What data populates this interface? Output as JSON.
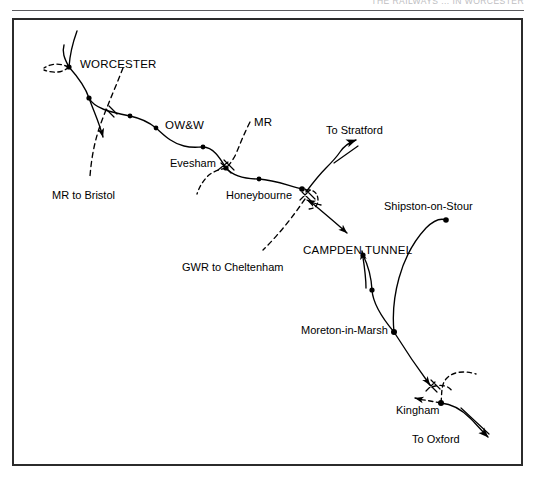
{
  "page": {
    "running_header": "THE RAILWAYS ... IN WORCESTER",
    "background_color": "#ffffff",
    "ink_color": "#000000",
    "frame_color": "#2b2b2b"
  },
  "figure": {
    "type": "railway-route-diagram",
    "frame": {
      "x": 12,
      "y": 18,
      "width": 511,
      "height": 448
    }
  },
  "labels": [
    {
      "id": "worcester",
      "text": "WORCESTER",
      "x": 80,
      "y": 59,
      "style": "caps"
    },
    {
      "id": "owandw",
      "text": "OW&W",
      "x": 165,
      "y": 120,
      "style": "caps"
    },
    {
      "id": "mr",
      "text": "MR",
      "x": 254,
      "y": 117,
      "style": "caps"
    },
    {
      "id": "to-stratford",
      "text": "To Stratford",
      "x": 326,
      "y": 125,
      "style": "normal"
    },
    {
      "id": "evesham",
      "text": "Evesham",
      "x": 170,
      "y": 158,
      "style": "normal"
    },
    {
      "id": "honeybourne",
      "text": "Honeybourne",
      "x": 226,
      "y": 190,
      "style": "normal"
    },
    {
      "id": "mr-to-bristol",
      "text": "MR to Bristol",
      "x": 52,
      "y": 190,
      "style": "normal"
    },
    {
      "id": "shipston-on-stour",
      "text": "Shipston-on-Stour",
      "x": 384,
      "y": 201,
      "style": "normal"
    },
    {
      "id": "campden-tunnel",
      "text": "CAMPDEN TUNNEL",
      "x": 303,
      "y": 245,
      "style": "caps"
    },
    {
      "id": "gwr-to-cheltenham",
      "text": "GWR to Cheltenham",
      "x": 182,
      "y": 262,
      "style": "normal"
    },
    {
      "id": "moreton-in-marsh",
      "text": "Moreton-in-Marsh",
      "x": 301,
      "y": 325,
      "style": "normal"
    },
    {
      "id": "kingham",
      "text": "Kingham",
      "x": 396,
      "y": 405,
      "style": "normal"
    },
    {
      "id": "to-oxford",
      "text": "To Oxford",
      "x": 412,
      "y": 434,
      "style": "normal"
    }
  ],
  "stations": [
    {
      "id": "station-worcester-west",
      "label": "Worcester west junction",
      "x": 69,
      "y": 67
    },
    {
      "id": "station-worcester-south",
      "label": "Worcester south",
      "x": 89,
      "y": 98
    },
    {
      "id": "station-owandw-1",
      "label": "OW&W intermediate 1",
      "x": 130,
      "y": 116
    },
    {
      "id": "station-owandw-2",
      "label": "OW&W intermediate 2",
      "x": 156,
      "y": 128
    },
    {
      "id": "station-owandw-3",
      "label": "OW&W intermediate 3",
      "x": 203,
      "y": 147
    },
    {
      "id": "station-evesham",
      "label": "Evesham",
      "x": 226,
      "y": 168
    },
    {
      "id": "station-honeybourne-mid",
      "label": "Honeybourne approach",
      "x": 259,
      "y": 179
    },
    {
      "id": "station-honeybourne",
      "label": "Honeybourne",
      "x": 302,
      "y": 189
    },
    {
      "id": "station-campden",
      "label": "Campden",
      "x": 363,
      "y": 255
    },
    {
      "id": "station-blockley",
      "label": "Blockley",
      "x": 372,
      "y": 290
    },
    {
      "id": "station-moreton",
      "label": "Moreton-in-Marsh",
      "x": 394,
      "y": 332
    },
    {
      "id": "station-shipston",
      "label": "Shipston-on-Stour",
      "x": 446,
      "y": 220
    },
    {
      "id": "station-kingham",
      "label": "Kingham",
      "x": 441,
      "y": 403
    }
  ],
  "lines": [
    {
      "id": "line-owandw-main",
      "name": "OW&W main line Worcester - Honeybourne",
      "style": "solid"
    },
    {
      "id": "line-worcester-north",
      "name": "Worcester northern approach",
      "style": "solid"
    },
    {
      "id": "line-worcester-branch",
      "name": "Worcester branch with arrow",
      "style": "solid"
    },
    {
      "id": "line-mr-dashed",
      "name": "Midland Railway (dashed)",
      "style": "dashed"
    },
    {
      "id": "line-mr-bristol",
      "name": "MR to Bristol (dashed)",
      "style": "dashed"
    },
    {
      "id": "line-gwr-cheltenham",
      "name": "GWR to Cheltenham (dashed)",
      "style": "dashed"
    },
    {
      "id": "line-to-stratford",
      "name": "Honeybourne to Stratford",
      "style": "solid"
    },
    {
      "id": "line-campden",
      "name": "Honeybourne - Campden Tunnel - Moreton",
      "style": "solid"
    },
    {
      "id": "line-shipston-branch",
      "name": "Moreton-in-Marsh to Shipston-on-Stour",
      "style": "solid"
    },
    {
      "id": "line-moreton-kingham",
      "name": "Moreton-in-Marsh to Kingham",
      "style": "solid"
    },
    {
      "id": "line-kingham-dashed",
      "name": "Kingham junction lines (dashed)",
      "style": "dashed"
    },
    {
      "id": "line-to-oxford",
      "name": "Kingham to Oxford",
      "style": "solid"
    }
  ]
}
